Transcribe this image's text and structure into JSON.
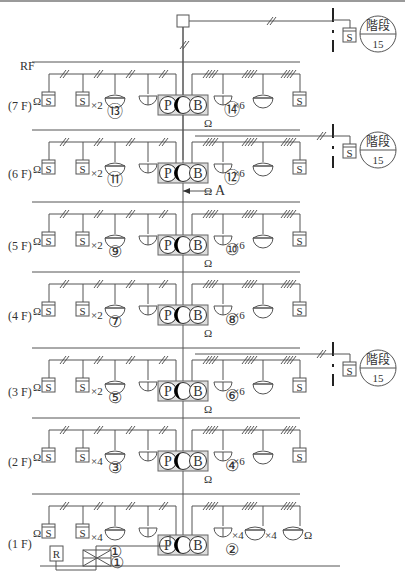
{
  "labels": {
    "rf": "RF",
    "arrow_label": "A",
    "stair_top": "階段",
    "stair_bottom": "15",
    "sensor": "S",
    "remote": "R",
    "p": "P",
    "b": "B",
    "omega": "Ω"
  },
  "floors": [
    {
      "id": "7F",
      "label": "(7 F)",
      "y": 95,
      "left_no": "⑬",
      "right_no": "⑭",
      "left_mult": "×2",
      "right_mult": "×6",
      "stair": false
    },
    {
      "id": "6F",
      "label": "(6 F)",
      "y": 175,
      "left_no": "⑪",
      "right_no": "⑫",
      "left_mult": "×2",
      "right_mult": "×6",
      "stair": true
    },
    {
      "id": "5F",
      "label": "(5 F)",
      "y": 250,
      "left_no": "⑨",
      "right_no": "⑩",
      "left_mult": "×2",
      "right_mult": "×6",
      "stair": false
    },
    {
      "id": "4F",
      "label": "(4 F)",
      "y": 325,
      "left_no": "⑦",
      "right_no": "⑧",
      "left_mult": "×2",
      "right_mult": "×6",
      "stair": false
    },
    {
      "id": "3F",
      "label": "(3 F)",
      "y": 400,
      "left_no": "⑤",
      "right_no": "⑥",
      "left_mult": "×2",
      "right_mult": "×6",
      "stair": true
    },
    {
      "id": "2F",
      "label": "(2 F)",
      "y": 470,
      "left_no": "③",
      "right_no": "④",
      "left_mult": "×4",
      "right_mult": "×6",
      "stair": false
    },
    {
      "id": "1F",
      "label": "(1 F)",
      "y": 545,
      "left_no": "①",
      "right_no": "②",
      "left_mult": "×4",
      "right_mult": "×4",
      "right_mult2": "×4",
      "stair": false
    }
  ]
}
